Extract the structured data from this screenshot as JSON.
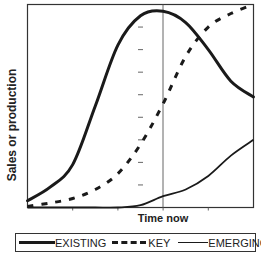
{
  "chart_data": {
    "type": "line",
    "title": "",
    "xlabel": "Time now",
    "ylabel": "Sales or production",
    "x_ticks_count": 5,
    "y_ticks_count": 9,
    "grid": false,
    "reference_line": {
      "x": "Time now",
      "position": "center"
    },
    "legend_position": "bottom",
    "x": [
      0,
      1,
      2,
      3,
      4,
      5,
      6,
      7,
      8,
      9,
      10
    ],
    "xlim": [
      0,
      10
    ],
    "ylim": [
      0,
      9
    ],
    "series": [
      {
        "name": "EXISTING",
        "style": "solid-thick",
        "values": [
          0.3,
          0.9,
          1.9,
          4.5,
          7.2,
          8.5,
          8.7,
          8.2,
          7.0,
          5.6,
          4.9
        ]
      },
      {
        "name": "KEY",
        "style": "dashed",
        "values": [
          0.05,
          0.2,
          0.4,
          0.8,
          1.5,
          2.8,
          4.6,
          6.7,
          8.0,
          8.6,
          9.0
        ]
      },
      {
        "name": "EMERGING",
        "style": "solid-thin",
        "values": [
          0.0,
          0.0,
          0.0,
          0.0,
          0.0,
          0.1,
          0.5,
          0.8,
          1.4,
          2.3,
          3.0
        ]
      }
    ]
  },
  "legend": {
    "items": [
      {
        "label": "EXISTING"
      },
      {
        "label": "KEY"
      },
      {
        "label": "EMERGING"
      }
    ]
  },
  "axes": {
    "xlabel": "Time now",
    "ylabel": "Sales or production"
  },
  "colors": {
    "line": "#1a1a1a",
    "axis": "#333333",
    "background": "#ffffff"
  }
}
